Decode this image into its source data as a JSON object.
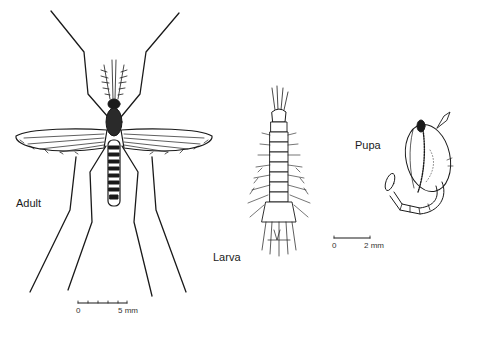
{
  "figure": {
    "stages": [
      {
        "id": "adult",
        "label": "Adult"
      },
      {
        "id": "larva",
        "label": "Larva"
      },
      {
        "id": "pupa",
        "label": "Pupa"
      }
    ],
    "scale_bars": [
      {
        "for": "adult",
        "start_label": "0",
        "end_label": "5 mm"
      },
      {
        "for": "larva-pupa",
        "start_label": "0",
        "end_label": "2 mm"
      }
    ],
    "colors": {
      "ink": "#1a1a1a",
      "background": "#ffffff"
    }
  }
}
